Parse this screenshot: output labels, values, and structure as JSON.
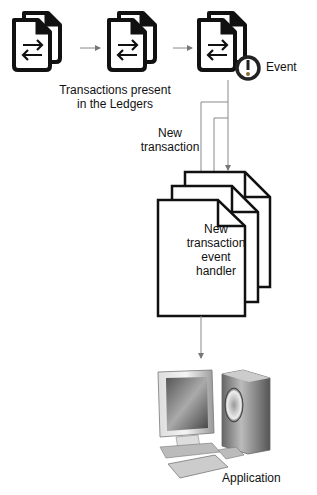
{
  "ledger": {
    "caption_line1": "Transactions present",
    "caption_line2": "in the Ledgers",
    "documents": [
      {
        "icon": "transaction-document-icon"
      },
      {
        "icon": "transaction-document-icon"
      },
      {
        "icon": "transaction-document-icon",
        "badge": "alert-icon"
      }
    ]
  },
  "event": {
    "label": "Event"
  },
  "new_transaction": {
    "line1": "New",
    "line2": "transaction"
  },
  "handler": {
    "line1": "New",
    "line2": "transaction",
    "line3": "event",
    "line4": "handler"
  },
  "application": {
    "label": "Application",
    "icon": "computer-icon"
  },
  "colors": {
    "stroke": "#111111",
    "arrow": "#888888",
    "background": "#ffffff"
  }
}
